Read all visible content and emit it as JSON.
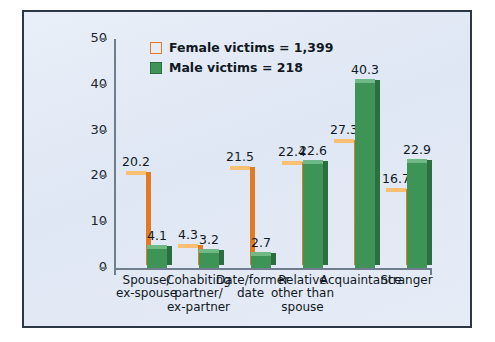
{
  "chart_data": {
    "type": "bar",
    "title": "",
    "xlabel": "",
    "ylabel": "",
    "ylim": [
      0,
      50
    ],
    "yticks": [
      0,
      10,
      20,
      30,
      40,
      50
    ],
    "grid": false,
    "legend_position": "top-left",
    "categories": [
      "Spouse/\nex-spouse",
      "Cohabiting\npartner/\nex-partner",
      "Date/former\ndate",
      "Relative\nother than\nspouse",
      "Acquaintance",
      "Stranger"
    ],
    "series": [
      {
        "name": "Female victims = 1,399",
        "color": "#f5a council",
        "values": [
          20.2,
          4.3,
          21.5,
          22.4,
          27.3,
          16.7
        ]
      },
      {
        "name": "Male victims = 218",
        "color": "#3e9456",
        "values": [
          4.1,
          3.2,
          2.7,
          22.6,
          40.3,
          22.9
        ]
      }
    ]
  },
  "legend": {
    "items": [
      {
        "label": "Female victims = 1,399"
      },
      {
        "label": "Male victims = 218"
      }
    ]
  },
  "colors": {
    "female": "#f5a council",
    "female_side": "#e07a23",
    "female_top": "#f9bf72",
    "male": "#3e9456",
    "male_side": "#2c6f3e",
    "male_top": "#6fb986",
    "frame": "#2b3744",
    "panel": "#e6ecf6",
    "axis": "#6f7d8c",
    "text": "#11181f"
  }
}
